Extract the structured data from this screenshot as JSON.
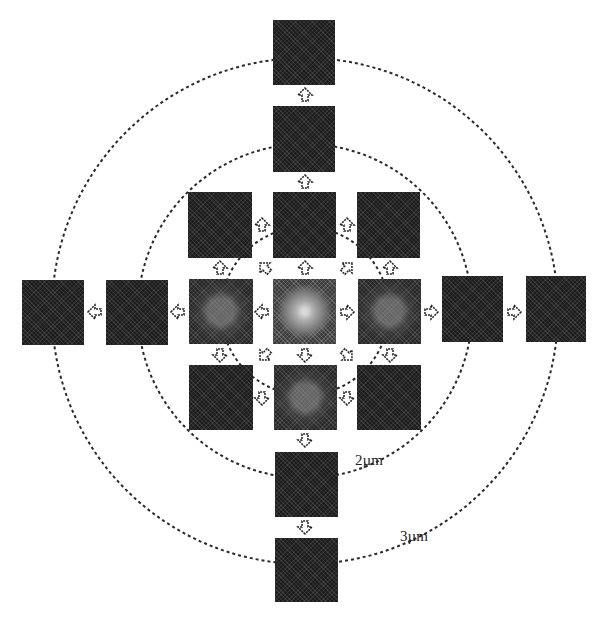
{
  "diagram": {
    "center": {
      "x": 305,
      "y": 311
    },
    "rings": [
      {
        "name": "inner-ring",
        "radius": 84,
        "label": ""
      },
      {
        "name": "ring-2um",
        "radius": 167,
        "label": "2µm"
      },
      {
        "name": "ring-3um",
        "radius": 253,
        "label": "3µm"
      }
    ],
    "labels": {
      "ring_2um": "2µm",
      "ring_3um": "3µm"
    },
    "tiles": [
      {
        "id": "top-outer",
        "x": 273,
        "y": 20,
        "w": 62,
        "h": 65,
        "type": "dark"
      },
      {
        "id": "top-inner",
        "x": 273,
        "y": 106,
        "w": 62,
        "h": 66,
        "type": "dark"
      },
      {
        "id": "upper-left",
        "x": 188,
        "y": 192,
        "w": 64,
        "h": 66,
        "type": "dark"
      },
      {
        "id": "upper-center",
        "x": 273,
        "y": 192,
        "w": 63,
        "h": 66,
        "type": "dark"
      },
      {
        "id": "upper-right",
        "x": 357,
        "y": 192,
        "w": 63,
        "h": 66,
        "type": "dark"
      },
      {
        "id": "left-outer",
        "x": 22,
        "y": 280,
        "w": 62,
        "h": 65,
        "type": "dark"
      },
      {
        "id": "left-inner",
        "x": 106,
        "y": 280,
        "w": 62,
        "h": 65,
        "type": "dark"
      },
      {
        "id": "mid-left",
        "x": 189,
        "y": 279,
        "w": 64,
        "h": 65,
        "type": "mid"
      },
      {
        "id": "center",
        "x": 273,
        "y": 279,
        "w": 63,
        "h": 65,
        "type": "center"
      },
      {
        "id": "mid-right",
        "x": 358,
        "y": 279,
        "w": 63,
        "h": 65,
        "type": "mid"
      },
      {
        "id": "right-inner",
        "x": 442,
        "y": 276,
        "w": 61,
        "h": 66,
        "type": "dark"
      },
      {
        "id": "right-outer",
        "x": 526,
        "y": 276,
        "w": 60,
        "h": 66,
        "type": "dark"
      },
      {
        "id": "lower-left",
        "x": 189,
        "y": 365,
        "w": 64,
        "h": 65,
        "type": "dark"
      },
      {
        "id": "lower-center",
        "x": 274,
        "y": 365,
        "w": 63,
        "h": 65,
        "type": "mid"
      },
      {
        "id": "lower-right",
        "x": 357,
        "y": 365,
        "w": 64,
        "h": 65,
        "type": "dark"
      },
      {
        "id": "bottom-inner",
        "x": 275,
        "y": 452,
        "w": 63,
        "h": 65,
        "type": "dark"
      },
      {
        "id": "bottom-outer",
        "x": 275,
        "y": 538,
        "w": 63,
        "h": 64,
        "type": "dark"
      }
    ],
    "arrows": [
      {
        "x": 305,
        "y": 95,
        "dir": "up"
      },
      {
        "x": 305,
        "y": 182,
        "dir": "up"
      },
      {
        "x": 305,
        "y": 268,
        "dir": "up"
      },
      {
        "x": 305,
        "y": 355,
        "dir": "down"
      },
      {
        "x": 305,
        "y": 440,
        "dir": "down"
      },
      {
        "x": 305,
        "y": 527,
        "dir": "down"
      },
      {
        "x": 95,
        "y": 312,
        "dir": "left"
      },
      {
        "x": 178,
        "y": 312,
        "dir": "left"
      },
      {
        "x": 262,
        "y": 312,
        "dir": "left"
      },
      {
        "x": 347,
        "y": 312,
        "dir": "right"
      },
      {
        "x": 431,
        "y": 312,
        "dir": "right"
      },
      {
        "x": 514,
        "y": 312,
        "dir": "right"
      },
      {
        "x": 262,
        "y": 225,
        "dir": "up"
      },
      {
        "x": 347,
        "y": 225,
        "dir": "up"
      },
      {
        "x": 262,
        "y": 398,
        "dir": "down"
      },
      {
        "x": 347,
        "y": 398,
        "dir": "down"
      },
      {
        "x": 220,
        "y": 268,
        "dir": "up"
      },
      {
        "x": 390,
        "y": 268,
        "dir": "up"
      },
      {
        "x": 220,
        "y": 355,
        "dir": "down"
      },
      {
        "x": 390,
        "y": 355,
        "dir": "down"
      },
      {
        "x": 265,
        "y": 268,
        "dir": "up-left"
      },
      {
        "x": 347,
        "y": 268,
        "dir": "up-right"
      },
      {
        "x": 265,
        "y": 355,
        "dir": "down-left"
      },
      {
        "x": 347,
        "y": 355,
        "dir": "down-right"
      }
    ]
  }
}
